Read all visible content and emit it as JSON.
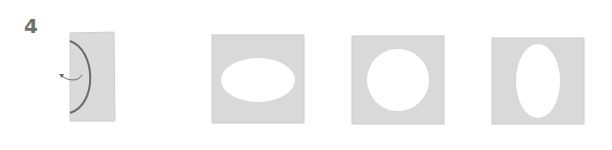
{
  "step": {
    "number": "4"
  },
  "colors": {
    "paper": "#d9d9d9",
    "paper_edge": "#c8c8c8",
    "fold_line": "#6b6b6b",
    "cutout": "#ffffff",
    "step_number": "#6e6e6e"
  },
  "figures": [
    {
      "id": "folded-card",
      "description": "folded card with half-oval cut line and arrow"
    },
    {
      "id": "horizontal-oval",
      "description": "square with horizontal oval cutout"
    },
    {
      "id": "circle",
      "description": "square with circular cutout"
    },
    {
      "id": "vertical-oval",
      "description": "square with vertical oval cutout"
    }
  ]
}
